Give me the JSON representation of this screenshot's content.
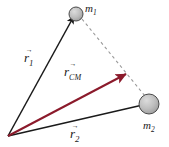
{
  "figure": {
    "background_color": "#ffffff"
  },
  "colors": {
    "vector_black": "#1a1a1a",
    "vector_cm_red": "#8b1a2b",
    "dashed_line": "#9a9a9a",
    "mass_fill": "#b9b9b9",
    "mass_stroke": "#4a4a4a",
    "text": "#1a1a1a"
  },
  "masses": [
    {
      "id": "m1",
      "label_base": "m",
      "label_sub": "1",
      "center_x": 76,
      "center_y": 14,
      "radius": 7
    },
    {
      "id": "m2",
      "label_base": "m",
      "label_sub": "2",
      "center_x": 149,
      "center_y": 104,
      "radius": 10
    }
  ],
  "origin": {
    "x": 8,
    "y": 136,
    "label": "origin"
  },
  "vectors": [
    {
      "id": "r1",
      "label_base": "r",
      "label_sub": "1",
      "color": "#1a1a1a",
      "from_x": 8,
      "from_y": 136,
      "to_x": 74,
      "to_y": 16
    },
    {
      "id": "rcm",
      "label_base": "r",
      "label_sub": "CM",
      "color": "#8b1a2b",
      "from_x": 8,
      "from_y": 136,
      "to_x": 126,
      "to_y": 74
    },
    {
      "id": "r2",
      "label_base": "r",
      "label_sub": "2",
      "color": "#1a1a1a",
      "from_x": 8,
      "from_y": 136,
      "to_x": 147,
      "to_y": 104
    }
  ],
  "dashed_connector": {
    "id": "m1-m2-dashed",
    "from_x": 82,
    "from_y": 19,
    "to_x": 145,
    "to_y": 96,
    "dash_pattern": "3,3"
  },
  "labels": {
    "r1": {
      "arrowbar": "→",
      "base": "r",
      "sub": "1"
    },
    "rcm": {
      "arrowbar": "→",
      "base": "r",
      "sub": "CM"
    },
    "r2": {
      "arrowbar": "→",
      "base": "r",
      "sub": "2"
    },
    "m1": {
      "base": "m",
      "sub": "1"
    },
    "m2": {
      "base": "m",
      "sub": "2"
    }
  }
}
